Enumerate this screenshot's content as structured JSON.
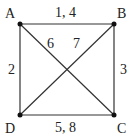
{
  "diagram": {
    "type": "graph",
    "vertices": [
      {
        "id": "A",
        "label": "A",
        "x": 20,
        "y": 24,
        "label_x": 5,
        "label_y": 7
      },
      {
        "id": "B",
        "label": "B",
        "x": 114,
        "y": 24,
        "label_x": 117,
        "label_y": 7
      },
      {
        "id": "C",
        "label": "C",
        "x": 114,
        "y": 115,
        "label_x": 117,
        "label_y": 122
      },
      {
        "id": "D",
        "label": "D",
        "x": 20,
        "y": 115,
        "label_x": 5,
        "label_y": 122
      }
    ],
    "edges": [
      {
        "from": "A",
        "to": "B",
        "label": "1, 4",
        "label_x": 55,
        "label_y": 6
      },
      {
        "from": "A",
        "to": "D",
        "label": "2",
        "label_x": 8,
        "label_y": 63
      },
      {
        "from": "B",
        "to": "C",
        "label": "3",
        "label_x": 120,
        "label_y": 63
      },
      {
        "from": "D",
        "to": "C",
        "label": "5, 8",
        "label_x": 55,
        "label_y": 121
      },
      {
        "from": "A",
        "to": "C",
        "label": "6",
        "label_x": 47,
        "label_y": 37
      },
      {
        "from": "B",
        "to": "D",
        "label": "7",
        "label_x": 73,
        "label_y": 37
      }
    ],
    "colors": {
      "line": "#333333",
      "vertex": "#111111",
      "text": "#222222"
    }
  }
}
